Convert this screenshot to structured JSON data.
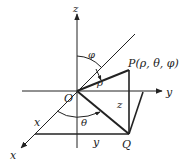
{
  "diagram": {
    "labels": {
      "z_axis": "z",
      "y_axis": "y",
      "x_axis": "x",
      "x_coord": "x",
      "y_coord": "y",
      "z_coord": "z",
      "origin": "O",
      "phi": "φ",
      "theta": "θ",
      "rho": "ρ",
      "point_p": "P(ρ, θ, φ)",
      "point_q": "Q"
    },
    "colors": {
      "stroke": "#222222",
      "background": "#ffffff"
    }
  }
}
